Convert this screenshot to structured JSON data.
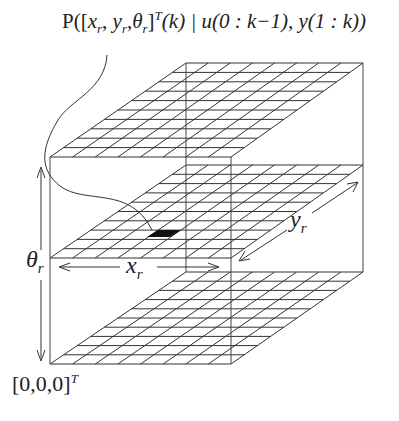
{
  "title_formula": {
    "P": "P([",
    "xr": "x",
    "sep1": ", ",
    "yr": "y",
    "sep2": ",",
    "th": "θ",
    "close": "]",
    "sup": "T",
    "rest": "(k) | u(0 : k−1), y(1 : k))",
    "sub": "r"
  },
  "axes": {
    "theta_label": "θ",
    "x_label": "x",
    "y_label": "y",
    "subscript": "r",
    "origin_label": "[0,0,0]",
    "origin_sup": "T"
  },
  "grid": {
    "columns": 8,
    "rows": 10,
    "line_color": "#333333",
    "highlight_color": "#111111"
  },
  "planes": [
    {
      "name": "top",
      "front_y": 157,
      "back_y": 63
    },
    {
      "name": "middle",
      "front_y": 258,
      "back_y": 165
    },
    {
      "name": "bottom",
      "front_y": 364,
      "back_y": 272
    }
  ]
}
